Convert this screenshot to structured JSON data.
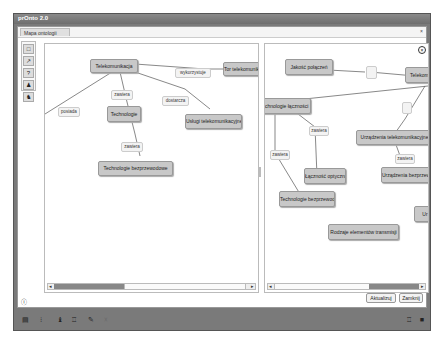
{
  "window": {
    "title": "prOnto 2.0"
  },
  "tab": {
    "label": "Mapa ontologii",
    "close": "×"
  },
  "palette": {
    "items": [
      {
        "name": "node-tool",
        "glyph": "□"
      },
      {
        "name": "link-tool",
        "glyph": "↗"
      },
      {
        "name": "help-tool",
        "glyph": "?"
      },
      {
        "name": "person-tool",
        "glyph": "♟"
      },
      {
        "name": "person-link-tool",
        "glyph": "♞"
      }
    ]
  },
  "left_map": {
    "nodes": [
      {
        "id": "telekom",
        "label": "Telekomunikacja"
      },
      {
        "id": "tor",
        "label": "Tor telekomunikacyjny"
      },
      {
        "id": "technologie",
        "label": "Technologie"
      },
      {
        "id": "uslugi",
        "label": "Usługi telekomunikacyjne"
      },
      {
        "id": "tech_bezp",
        "label": "Technologie bezprzewodowe"
      }
    ],
    "links": [
      {
        "label": "posiada"
      },
      {
        "label": "zawiera"
      },
      {
        "label": "wykorzystuje"
      },
      {
        "label": "dostarcza"
      },
      {
        "label": "zawiera"
      }
    ]
  },
  "right_map": {
    "nodes": [
      {
        "id": "jakosc",
        "label": "Jakość połączeń"
      },
      {
        "id": "telekom",
        "label": "Telekomunikacja"
      },
      {
        "id": "tech_lacz",
        "label": "Technologie łączności"
      },
      {
        "id": "urz_tel",
        "label": "Urządzenia telekomunikacyjne"
      },
      {
        "id": "lacznosc",
        "label": "Łączność optyczna"
      },
      {
        "id": "urz_bezp",
        "label": "Urządzenia bezprzewodowe"
      },
      {
        "id": "tech_bezp",
        "label": "Technologie bezprzewodowe"
      },
      {
        "id": "rodzaje",
        "label": "Rodzaje elementów transmisji"
      },
      {
        "id": "ur",
        "label": "Ur"
      }
    ],
    "links": [
      {
        "label": "zawiera"
      },
      {
        "label": "zawiera"
      },
      {
        "label": "zawiera"
      }
    ]
  },
  "scroll": {
    "grip": "|||",
    "left_arrow": "◂",
    "right_arrow": "▸"
  },
  "buttons": {
    "update": "Aktualizuj",
    "close": "Zamknij"
  },
  "info_icon": "ⓘ",
  "statusbar": {
    "left_icons": [
      "▤",
      "⁝",
      "♝",
      "♖",
      "✎",
      "☓"
    ],
    "right_icons": [
      "♖",
      "■"
    ]
  }
}
